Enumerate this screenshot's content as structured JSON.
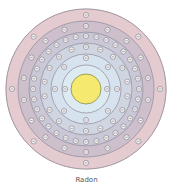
{
  "diagram": {
    "type": "bohr-model",
    "caption": "Radon",
    "center": [
      86,
      89
    ],
    "nucleus": {
      "radius": 15,
      "color": "#f5e96f",
      "stroke": "#8a8a4a"
    },
    "outer_ring": {
      "radius": 80,
      "color": "#ead2d5"
    },
    "electron": {
      "symbol": "⊖",
      "radius": 2.6,
      "fill": "#f3eef0",
      "stroke": "#6a6a72"
    },
    "shells": [
      {
        "n": 1,
        "electrons": 2,
        "orbit": 21,
        "boundary": 24,
        "color": "#dcebf2"
      },
      {
        "n": 2,
        "electrons": 8,
        "orbit": 31,
        "boundary": 35,
        "color": "#d6e3ee"
      },
      {
        "n": 3,
        "electrons": 18,
        "orbit": 42,
        "boundary": 46,
        "color": "#cfd6e2"
      },
      {
        "n": 4,
        "electrons": 32,
        "orbit": 53,
        "boundary": 57,
        "color": "#cac8d6"
      },
      {
        "n": 5,
        "electrons": 18,
        "orbit": 63,
        "boundary": 68,
        "color": "#cdbfcb"
      },
      {
        "n": 6,
        "electrons": 8,
        "orbit": 74,
        "boundary": 80,
        "color": "#e3cbd0"
      }
    ]
  }
}
